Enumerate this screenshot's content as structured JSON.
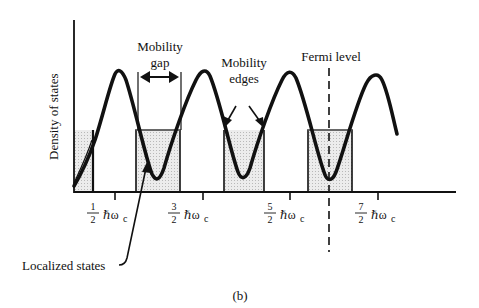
{
  "figure": {
    "caption": "(b)",
    "y_axis_label": "Density of states",
    "annotations": {
      "mobility_gap": [
        "Mobility",
        "gap"
      ],
      "mobility_edges": [
        "Mobility",
        "edges"
      ],
      "fermi_level": "Fermi level",
      "localized_states": "Localized states"
    },
    "x_ticks": [
      {
        "num": "1",
        "den": "2",
        "unit": "ℏω",
        "sub": "c"
      },
      {
        "num": "3",
        "den": "2",
        "unit": "ℏω",
        "sub": "c"
      },
      {
        "num": "5",
        "den": "2",
        "unit": "ℏω",
        "sub": "c"
      },
      {
        "num": "7",
        "den": "2",
        "unit": "ℏω",
        "sub": "c"
      }
    ],
    "colors": {
      "line": "#111111",
      "shade": "#e2e2e2"
    }
  }
}
